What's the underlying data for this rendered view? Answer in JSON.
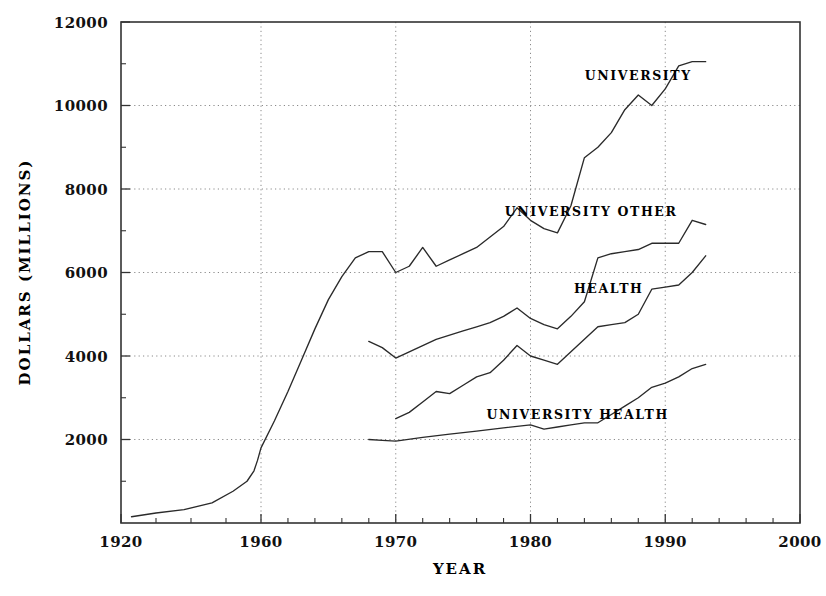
{
  "chart_data": {
    "type": "line",
    "title": "",
    "xlabel": "YEAR",
    "ylabel": "DOLLARS (MILLIONS)",
    "xlim": [
      1920,
      2000
    ],
    "ylim": [
      0,
      12000
    ],
    "x_tick_labels": [
      "1920",
      "1960",
      "1970",
      "1980",
      "1990",
      "2000"
    ],
    "x_tick_values": [
      1920,
      1960,
      1970,
      1980,
      1990,
      2000
    ],
    "y_tick_labels": [
      "2000",
      "4000",
      "6000",
      "8000",
      "10000",
      "12000"
    ],
    "y_tick_values": [
      2000,
      4000,
      6000,
      8000,
      10000,
      12000
    ],
    "grid": "dotted-both",
    "legend_position": "inline-right-of-curves",
    "axis_note": "x-axis compressed between 1920 and 1960",
    "series": [
      {
        "name": "UNIVERSITY",
        "label": "UNIVERSITY",
        "label_x": 1988.0,
        "label_y": 10600,
        "x": [
          1923,
          1930,
          1938,
          1946,
          1952,
          1956,
          1958,
          1959,
          1960,
          1961,
          1962,
          1963,
          1964,
          1965,
          1966,
          1967,
          1968,
          1969,
          1970,
          1971,
          1972,
          1973,
          1974,
          1975,
          1976,
          1977,
          1978,
          1979,
          1980,
          1981,
          1982,
          1983,
          1984,
          1985,
          1986,
          1987,
          1988,
          1989,
          1990,
          1991,
          1992,
          1993
        ],
        "y": [
          150,
          240,
          320,
          480,
          760,
          1000,
          1250,
          1500,
          1800,
          2450,
          3150,
          3900,
          4650,
          5350,
          5900,
          6350,
          6500,
          6500,
          6000,
          6150,
          6600,
          6150,
          6300,
          6450,
          6600,
          6850,
          7100,
          7550,
          7250,
          7050,
          6950,
          7600,
          8750,
          9000,
          9350,
          9900,
          10250,
          10000,
          10400,
          10950,
          11050,
          11050
        ]
      },
      {
        "name": "UNIVERSITY OTHER",
        "label": "UNIVERSITY OTHER",
        "label_x": 1984.5,
        "label_y": 7350,
        "x": [
          1968,
          1969,
          1970,
          1971,
          1972,
          1973,
          1974,
          1975,
          1976,
          1977,
          1978,
          1979,
          1980,
          1981,
          1982,
          1983,
          1984,
          1985,
          1986,
          1987,
          1988,
          1989,
          1990,
          1991,
          1992,
          1993
        ],
        "y": [
          4350,
          4200,
          3950,
          4100,
          4250,
          4400,
          4500,
          4600,
          4700,
          4800,
          4950,
          5150,
          4900,
          4750,
          4650,
          4950,
          5300,
          6350,
          6450,
          6500,
          6550,
          6700,
          6700,
          6700,
          7250,
          7150
        ]
      },
      {
        "name": "HEALTH",
        "label": "HEALTH",
        "label_x": 1985.8,
        "label_y": 5500,
        "x": [
          1970,
          1971,
          1972,
          1973,
          1974,
          1975,
          1976,
          1977,
          1978,
          1979,
          1980,
          1981,
          1982,
          1983,
          1984,
          1985,
          1986,
          1987,
          1988,
          1989,
          1990,
          1991,
          1992,
          1993
        ],
        "y": [
          2500,
          2650,
          2900,
          3150,
          3100,
          3300,
          3500,
          3600,
          3900,
          4250,
          4000,
          3900,
          3800,
          4100,
          4400,
          4700,
          4750,
          4800,
          5000,
          5600,
          5650,
          5700,
          6000,
          6400
        ]
      },
      {
        "name": "UNIVERSITY HEALTH",
        "label": "UNIVERSITY HEALTH",
        "label_x": 1983.5,
        "label_y": 2500,
        "x": [
          1968,
          1969,
          1970,
          1972,
          1974,
          1976,
          1978,
          1980,
          1981,
          1982,
          1983,
          1984,
          1985,
          1986,
          1987,
          1988,
          1989,
          1990,
          1991,
          1992,
          1993
        ],
        "y": [
          2000,
          1980,
          1960,
          2050,
          2130,
          2200,
          2280,
          2350,
          2250,
          2300,
          2350,
          2400,
          2400,
          2600,
          2800,
          3000,
          3250,
          3350,
          3500,
          3700,
          3800
        ]
      }
    ]
  },
  "colors": {
    "line": "#2a2a2a",
    "grid": "#8a8a8a",
    "frame": "#333333",
    "background": "#ffffff",
    "text": "#000000"
  }
}
